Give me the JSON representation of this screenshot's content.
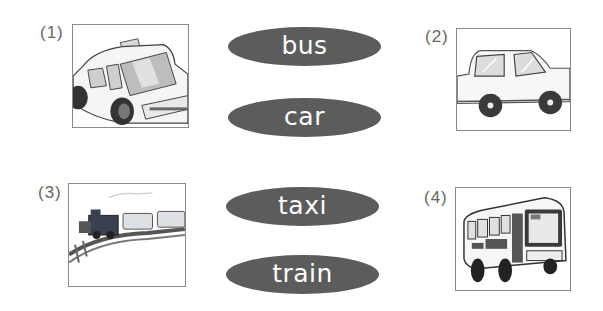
{
  "items": [
    {
      "number": "(1)",
      "picture": "taxi-picture"
    },
    {
      "number": "(2)",
      "picture": "car-picture"
    },
    {
      "number": "(3)",
      "picture": "train-picture"
    },
    {
      "number": "(4)",
      "picture": "bus-picture"
    }
  ],
  "words": [
    "bus",
    "car",
    "taxi",
    "train"
  ],
  "colors": {
    "word_pill": "#5c5c5c",
    "word_text": "#ffffff",
    "frame_border": "#8a8a8a",
    "number_text": "#666666"
  }
}
